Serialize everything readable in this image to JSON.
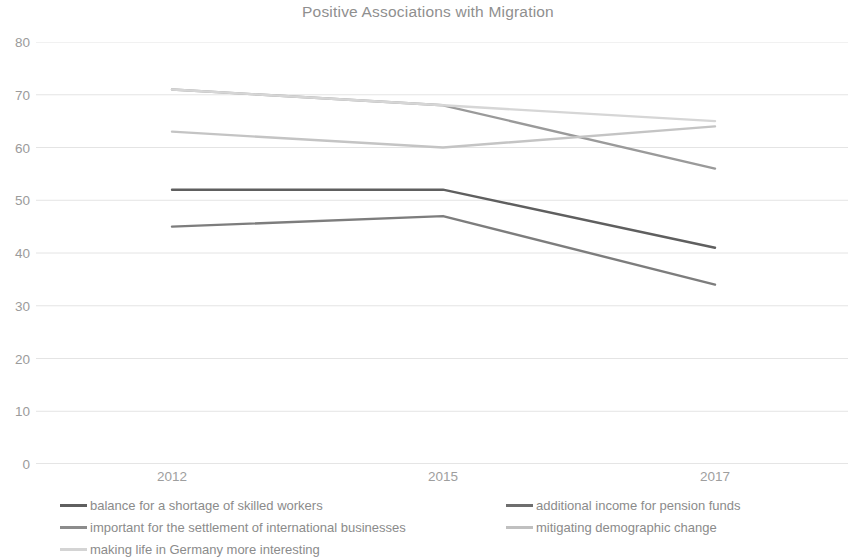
{
  "chart_data": {
    "type": "line",
    "title": "Positive Associations with Migration",
    "xlabel": "",
    "ylabel": "",
    "x": [
      "2012",
      "2015",
      "2017"
    ],
    "categories": [
      "2012",
      "2015",
      "2017"
    ],
    "ylim": [
      0,
      80
    ],
    "yticks": [
      0,
      10,
      20,
      30,
      40,
      50,
      60,
      70,
      80
    ],
    "ytick_labels": [
      "0",
      "10",
      "20",
      "30",
      "40",
      "50",
      "60",
      "70",
      "80"
    ],
    "grid": true,
    "grid_axis": "y",
    "legend_position": "bottom",
    "series": [
      {
        "name": "balance for a shortage of skilled workers",
        "values": [
          52,
          52,
          41
        ],
        "color": "#5f5f5f"
      },
      {
        "name": "additional income for pension funds",
        "values": [
          45,
          47,
          34
        ],
        "color": "#7d7d7d"
      },
      {
        "name": "important for the settlement of international businesses",
        "values": [
          71,
          68,
          56
        ],
        "color": "#9a9a9a"
      },
      {
        "name": "mitigating demographic change",
        "values": [
          63,
          60,
          64
        ],
        "color": "#c4c4c4"
      },
      {
        "name": "making life in Germany more interesting",
        "values": [
          71,
          68,
          65
        ],
        "color": "#d6d6d6"
      }
    ]
  },
  "chart": {
    "title": "Positive Associations with Migration",
    "x_tick_labels": [
      "2012",
      "2015",
      "2017"
    ],
    "y_tick_labels": [
      "80",
      "70",
      "60",
      "50",
      "40",
      "30",
      "20",
      "10",
      "0"
    ],
    "grid_color": "#e4e4e4",
    "axis_color": "#d8d8d8",
    "text_color": "#8f8f8f"
  },
  "legend": {
    "items": [
      {
        "label": "balance for a shortage of skilled workers",
        "color": "#5f5f5f"
      },
      {
        "label": "additional income for pension funds",
        "color": "#6e6e6e"
      },
      {
        "label": "important for the settlement of international businesses",
        "color": "#8c8c8c"
      },
      {
        "label": "mitigating demographic change",
        "color": "#c0c0c0"
      },
      {
        "label": "making life in Germany more interesting",
        "color": "#d4d4d4"
      }
    ]
  }
}
